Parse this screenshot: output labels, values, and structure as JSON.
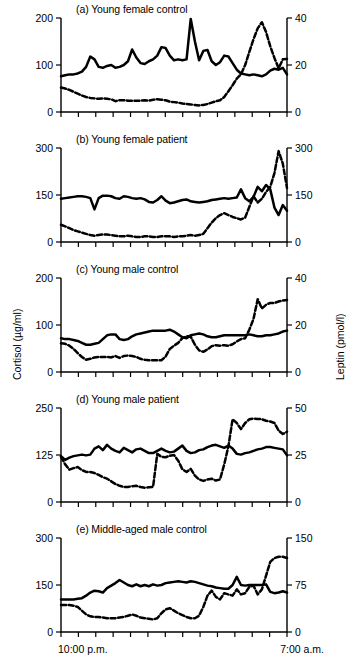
{
  "figure": {
    "axis_titles": {
      "left": "Cortisol (µg/ml)",
      "right": "Leptin (pmol/l)"
    },
    "x_axis": {
      "start_label": "10:00 p.m.",
      "end_label": "7:00 a.m.",
      "n_ticks": 14
    },
    "series_names": {
      "solid": "Cortisol",
      "dashed": "Leptin"
    }
  },
  "chart_data": [
    {
      "type": "line",
      "panel": "a",
      "title": "(a) Young female control",
      "xlabel": "",
      "x": [
        0,
        1,
        2,
        3,
        4,
        5,
        6,
        7,
        8,
        9,
        10,
        11,
        12,
        13,
        14,
        15,
        16,
        17,
        18,
        19,
        20,
        21,
        22,
        23,
        24,
        25,
        26,
        27,
        28,
        29,
        30,
        31,
        32,
        33,
        34,
        35,
        36,
        37,
        38,
        39,
        40,
        41,
        42,
        43,
        44,
        45,
        46,
        47,
        48,
        49,
        50,
        51,
        52,
        53,
        54
      ],
      "xlim": [
        0,
        54
      ],
      "series": [
        {
          "name": "Cortisol",
          "style": "solid",
          "axis": "left",
          "ylabel": "Cortisol (µg/ml)",
          "ylim": [
            0,
            200
          ],
          "yticks": [
            0,
            100,
            200
          ],
          "values": [
            76,
            78,
            80,
            80,
            82,
            86,
            96,
            118,
            112,
            96,
            94,
            98,
            100,
            94,
            96,
            100,
            108,
            133,
            116,
            104,
            102,
            108,
            112,
            120,
            138,
            136,
            120,
            110,
            112,
            110,
            112,
            198,
            150,
            110,
            130,
            132,
            108,
            100,
            106,
            120,
            118,
            104,
            90,
            82,
            80,
            78,
            80,
            78,
            76,
            80,
            88,
            92,
            90,
            94,
            80
          ]
        },
        {
          "name": "Leptin",
          "style": "dashed",
          "axis": "right",
          "ylabel": "Leptin (pmol/l)",
          "ylim": [
            0,
            40
          ],
          "yticks": [
            0,
            20,
            40
          ],
          "values": [
            10.4,
            10.0,
            9.4,
            8.6,
            7.8,
            7.0,
            6.4,
            6.0,
            5.8,
            5.6,
            5.8,
            5.6,
            5.4,
            4.6,
            5.0,
            5.0,
            4.8,
            4.8,
            4.8,
            4.8,
            5.0,
            4.8,
            5.2,
            5.4,
            5.2,
            5.0,
            4.4,
            4.2,
            4.0,
            3.6,
            3.4,
            3.2,
            3.0,
            2.8,
            3.0,
            3.4,
            4.0,
            4.6,
            5.0,
            6.4,
            8.8,
            11.4,
            14.2,
            16.0,
            20.0,
            25.6,
            31.0,
            35.6,
            38.2,
            34.0,
            28.0,
            23.0,
            18.6,
            22.4,
            22.6
          ]
        }
      ]
    },
    {
      "type": "line",
      "panel": "b",
      "title": "(b) Young female patient",
      "xlabel": "",
      "x": [
        0,
        1,
        2,
        3,
        4,
        5,
        6,
        7,
        8,
        9,
        10,
        11,
        12,
        13,
        14,
        15,
        16,
        17,
        18,
        19,
        20,
        21,
        22,
        23,
        24,
        25,
        26,
        27,
        28,
        29,
        30,
        31,
        32,
        33,
        34,
        35,
        36,
        37,
        38,
        39,
        40,
        41,
        42,
        43,
        44,
        45,
        46,
        47,
        48,
        49,
        50,
        51,
        52,
        53,
        54
      ],
      "xlim": [
        0,
        54
      ],
      "series": [
        {
          "name": "Cortisol",
          "style": "solid",
          "axis": "left",
          "ylabel": "Cortisol (µg/ml)",
          "ylim": [
            0,
            300
          ],
          "yticks": [
            0,
            150,
            300
          ],
          "values": [
            138,
            140,
            142,
            144,
            146,
            146,
            144,
            140,
            104,
            140,
            148,
            148,
            146,
            140,
            138,
            146,
            144,
            140,
            138,
            140,
            136,
            128,
            126,
            134,
            146,
            132,
            124,
            126,
            130,
            134,
            136,
            130,
            128,
            126,
            128,
            130,
            134,
            136,
            138,
            140,
            138,
            140,
            142,
            168,
            140,
            130,
            144,
            176,
            162,
            182,
            168,
            110,
            86,
            118,
            100
          ]
        },
        {
          "name": "Leptin",
          "style": "dashed",
          "axis": "right",
          "ylabel": "Leptin (pmol/l)",
          "ylim": [
            0,
            300
          ],
          "yticks": [
            0,
            150,
            300
          ],
          "values": [
            55,
            50,
            44,
            38,
            34,
            30,
            26,
            22,
            20,
            22,
            24,
            24,
            22,
            20,
            18,
            18,
            20,
            18,
            16,
            16,
            18,
            18,
            16,
            16,
            18,
            18,
            18,
            16,
            18,
            18,
            20,
            22,
            20,
            22,
            26,
            44,
            62,
            76,
            86,
            92,
            86,
            80,
            76,
            72,
            78,
            112,
            146,
            126,
            138,
            160,
            176,
            220,
            290,
            250,
            172
          ]
        }
      ]
    },
    {
      "type": "line",
      "panel": "c",
      "title": "(c) Young male control",
      "xlabel": "",
      "x": [
        0,
        1,
        2,
        3,
        4,
        5,
        6,
        7,
        8,
        9,
        10,
        11,
        12,
        13,
        14,
        15,
        16,
        17,
        18,
        19,
        20,
        21,
        22,
        23,
        24,
        25,
        26,
        27,
        28,
        29,
        30,
        31,
        32,
        33,
        34,
        35,
        36,
        37,
        38,
        39,
        40,
        41,
        42,
        43,
        44,
        45,
        46,
        47,
        48,
        49,
        50,
        51,
        52,
        53,
        54
      ],
      "xlim": [
        0,
        54
      ],
      "series": [
        {
          "name": "Cortisol",
          "style": "solid",
          "axis": "left",
          "ylabel": "Cortisol (µg/ml)",
          "ylim": [
            0,
            200
          ],
          "yticks": [
            0,
            100,
            200
          ],
          "values": [
            72,
            70,
            70,
            68,
            66,
            62,
            58,
            58,
            60,
            62,
            70,
            78,
            80,
            80,
            70,
            68,
            70,
            76,
            80,
            82,
            84,
            86,
            88,
            88,
            88,
            88,
            90,
            86,
            80,
            74,
            72,
            78,
            80,
            82,
            80,
            76,
            74,
            74,
            76,
            78,
            78,
            78,
            78,
            78,
            78,
            80,
            78,
            76,
            76,
            78,
            78,
            80,
            82,
            86,
            88
          ]
        },
        {
          "name": "Leptin",
          "style": "dashed",
          "axis": "right",
          "ylabel": "Leptin (pmol/l)",
          "ylim": [
            0,
            40
          ],
          "yticks": [
            0,
            20,
            40
          ],
          "values": [
            12.2,
            12.0,
            11.2,
            9.8,
            8.0,
            6.4,
            5.2,
            5.6,
            6.2,
            6.4,
            6.4,
            6.4,
            6.2,
            6.8,
            6.0,
            6.8,
            7.0,
            6.8,
            6.4,
            5.6,
            5.2,
            5.0,
            5.0,
            5.0,
            5.0,
            6.6,
            9.8,
            11.2,
            12.4,
            14.4,
            15.2,
            15.0,
            11.6,
            9.2,
            8.6,
            9.6,
            11.0,
            11.4,
            11.2,
            11.4,
            11.2,
            11.8,
            13.0,
            14.0,
            14.4,
            18.0,
            22.6,
            31.0,
            27.0,
            28.6,
            29.4,
            29.4,
            30.0,
            30.4,
            30.6
          ]
        }
      ]
    },
    {
      "type": "line",
      "panel": "d",
      "title": "(d) Young male patient",
      "xlabel": "",
      "x": [
        0,
        1,
        2,
        3,
        4,
        5,
        6,
        7,
        8,
        9,
        10,
        11,
        12,
        13,
        14,
        15,
        16,
        17,
        18,
        19,
        20,
        21,
        22,
        23,
        24,
        25,
        26,
        27,
        28,
        29,
        30,
        31,
        32,
        33,
        34,
        35,
        36,
        37,
        38,
        39,
        40,
        41,
        42,
        43,
        44,
        45,
        46,
        47,
        48,
        49,
        50,
        51,
        52,
        53,
        54
      ],
      "xlim": [
        0,
        54
      ],
      "series": [
        {
          "name": "Cortisol",
          "style": "solid",
          "axis": "left",
          "ylabel": "Cortisol (µg/ml)",
          "ylim": [
            0,
            250
          ],
          "yticks": [
            0,
            125,
            250
          ],
          "values": [
            122,
            112,
            118,
            122,
            124,
            126,
            124,
            126,
            142,
            148,
            138,
            152,
            142,
            136,
            132,
            144,
            138,
            132,
            140,
            142,
            136,
            130,
            130,
            136,
            142,
            136,
            132,
            134,
            142,
            150,
            136,
            130,
            132,
            138,
            140,
            146,
            150,
            152,
            148,
            144,
            150,
            142,
            128,
            126,
            130,
            132,
            136,
            140,
            142,
            146,
            146,
            144,
            142,
            140,
            124
          ]
        },
        {
          "name": "Leptin",
          "style": "dashed",
          "axis": "right",
          "ylabel": "Leptin (pmol/l)",
          "ylim": [
            0,
            50
          ],
          "yticks": [
            0,
            25,
            50
          ],
          "values": [
            24.0,
            20.0,
            17.2,
            18.0,
            18.6,
            17.0,
            16.0,
            16.0,
            15.4,
            14.4,
            13.2,
            12.4,
            11.0,
            9.6,
            8.6,
            8.0,
            8.0,
            8.4,
            8.6,
            8.0,
            7.6,
            7.8,
            8.0,
            25.6,
            24.0,
            23.8,
            24.6,
            25.0,
            22.0,
            17.4,
            16.0,
            17.6,
            14.0,
            12.0,
            11.2,
            12.0,
            12.4,
            11.4,
            12.0,
            20.0,
            29.6,
            44.0,
            42.0,
            38.8,
            42.0,
            44.0,
            44.4,
            44.2,
            44.0,
            43.2,
            42.8,
            42.0,
            38.0,
            36.2,
            37.4
          ]
        }
      ]
    },
    {
      "type": "line",
      "panel": "e",
      "title": "(e) Middle-aged male control",
      "xlabel": "",
      "x": [
        0,
        1,
        2,
        3,
        4,
        5,
        6,
        7,
        8,
        9,
        10,
        11,
        12,
        13,
        14,
        15,
        16,
        17,
        18,
        19,
        20,
        21,
        22,
        23,
        24,
        25,
        26,
        27,
        28,
        29,
        30,
        31,
        32,
        33,
        34,
        35,
        36,
        37,
        38,
        39,
        40,
        41,
        42,
        43,
        44,
        45,
        46,
        47,
        48,
        49,
        50,
        51,
        52,
        53,
        54
      ],
      "xlim": [
        0,
        54
      ],
      "series": [
        {
          "name": "Cortisol",
          "style": "solid",
          "axis": "left",
          "ylabel": "Cortisol (µg/ml)",
          "ylim": [
            0,
            300
          ],
          "yticks": [
            0,
            150,
            300
          ],
          "values": [
            104,
            104,
            104,
            104,
            106,
            108,
            116,
            126,
            132,
            130,
            126,
            140,
            148,
            156,
            166,
            158,
            150,
            146,
            152,
            146,
            150,
            146,
            152,
            148,
            150,
            156,
            158,
            160,
            162,
            160,
            158,
            162,
            160,
            156,
            152,
            148,
            146,
            142,
            140,
            138,
            138,
            150,
            176,
            150,
            148,
            150,
            150,
            150,
            150,
            152,
            128,
            124,
            126,
            130,
            126
          ]
        },
        {
          "name": "Leptin",
          "style": "dashed",
          "axis": "right",
          "ylabel": "Leptin (pmol/l)",
          "ylim": [
            0,
            150
          ],
          "yticks": [
            0,
            75,
            150
          ],
          "values": [
            43,
            43,
            43,
            42,
            40,
            34,
            28,
            25,
            24,
            24,
            23,
            22,
            22,
            22,
            23,
            24,
            26,
            28,
            26,
            23,
            22,
            21,
            20,
            22,
            30,
            36,
            38,
            34,
            30,
            27,
            24,
            22,
            22,
            26,
            40,
            58,
            66,
            56,
            52,
            62,
            60,
            58,
            68,
            60,
            62,
            72,
            74,
            60,
            68,
            90,
            112,
            118,
            120,
            120,
            118
          ]
        }
      ]
    }
  ]
}
